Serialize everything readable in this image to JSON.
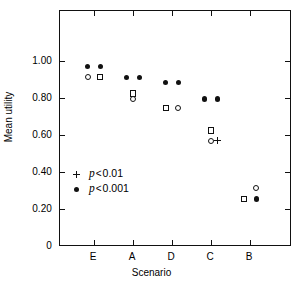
{
  "chart_data": {
    "type": "scatter",
    "title": "",
    "xlabel": "Scenario",
    "ylabel": "Mean utility",
    "categories": [
      "E",
      "A",
      "D",
      "C",
      "B"
    ],
    "ylim": [
      0,
      1.1
    ],
    "yticks": [
      0,
      0.2,
      0.4,
      0.6,
      0.8,
      1.0
    ],
    "ytick_labels": [
      "0",
      "0.20",
      "0.40",
      "0.60",
      "0.80",
      "1.00"
    ],
    "grid": false,
    "legend_position": "inside-lower-left",
    "points": [
      {
        "scenario": "E",
        "offset": -1,
        "value": 0.975,
        "marker": "filled-circle"
      },
      {
        "scenario": "E",
        "offset": 1,
        "value": 0.975,
        "marker": "filled-circle"
      },
      {
        "scenario": "E",
        "offset": -1,
        "value": 0.92,
        "marker": "open-circle"
      },
      {
        "scenario": "E",
        "offset": 1,
        "value": 0.92,
        "marker": "open-square"
      },
      {
        "scenario": "A",
        "offset": -1,
        "value": 0.915,
        "marker": "filled-circle"
      },
      {
        "scenario": "A",
        "offset": 1,
        "value": 0.915,
        "marker": "filled-circle"
      },
      {
        "scenario": "A",
        "offset": 0,
        "value": 0.83,
        "marker": "open-square"
      },
      {
        "scenario": "A",
        "offset": 0,
        "value": 0.8,
        "marker": "open-circle"
      },
      {
        "scenario": "D",
        "offset": -1,
        "value": 0.89,
        "marker": "filled-circle"
      },
      {
        "scenario": "D",
        "offset": 1,
        "value": 0.89,
        "marker": "filled-circle"
      },
      {
        "scenario": "D",
        "offset": -1,
        "value": 0.75,
        "marker": "open-square"
      },
      {
        "scenario": "D",
        "offset": 1,
        "value": 0.75,
        "marker": "open-circle"
      },
      {
        "scenario": "C",
        "offset": -1,
        "value": 0.8,
        "marker": "filled-circle"
      },
      {
        "scenario": "C",
        "offset": 1,
        "value": 0.8,
        "marker": "filled-circle"
      },
      {
        "scenario": "C",
        "offset": 0,
        "value": 0.63,
        "marker": "open-square"
      },
      {
        "scenario": "C",
        "offset": 0,
        "value": 0.575,
        "marker": "open-circle"
      },
      {
        "scenario": "C",
        "offset": 1,
        "value": 0.575,
        "marker": "plus"
      },
      {
        "scenario": "B",
        "offset": 1,
        "value": 0.32,
        "marker": "open-circle"
      },
      {
        "scenario": "B",
        "offset": -1,
        "value": 0.26,
        "marker": "open-square"
      },
      {
        "scenario": "B",
        "offset": 1,
        "value": 0.26,
        "marker": "filled-circle"
      }
    ],
    "legend": [
      {
        "marker": "plus",
        "symbol": "+",
        "p_label": "p",
        "operator": "<",
        "threshold": "0.01"
      },
      {
        "marker": "filled-circle",
        "symbol": "•",
        "p_label": "p",
        "operator": "<",
        "threshold": "0.001"
      }
    ]
  },
  "colors": {
    "ink": "#111111",
    "background": "#ffffff"
  }
}
